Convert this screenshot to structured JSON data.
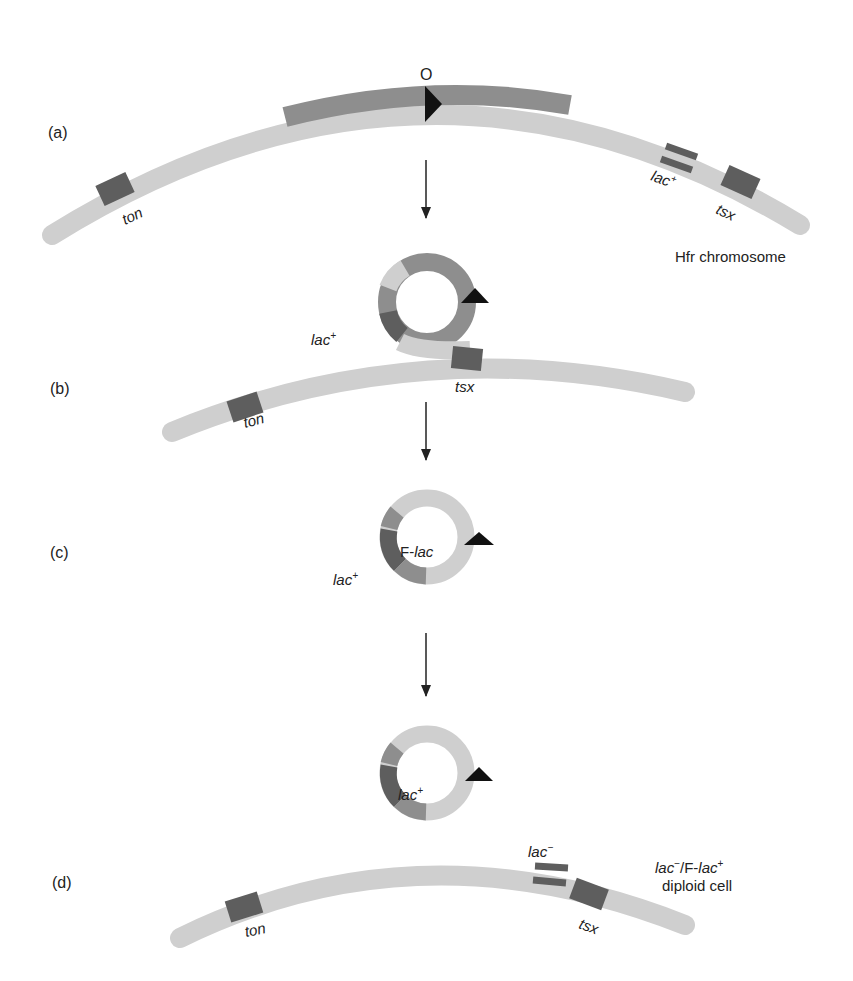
{
  "figure": {
    "panels": [
      {
        "id": "a",
        "label": "(a)",
        "origin_label": "O",
        "chromosome_caption": "Hfr chromosome",
        "genes": [
          "ton",
          "lac",
          "tsx"
        ],
        "lac_sup": "+"
      },
      {
        "id": "b",
        "label": "(b)",
        "genes": [
          "ton",
          "tsx"
        ],
        "loop_gene": "lac",
        "loop_sup": "+"
      },
      {
        "id": "c",
        "label": "(c)",
        "plasmid_name_prefix": "F-",
        "plasmid_name_gene": "lac",
        "gene": "lac",
        "gene_sup": "+"
      },
      {
        "id": "d",
        "label": "(d)",
        "plasmid_gene": "lac",
        "plasmid_sup": "+",
        "chrom_genes": [
          "ton",
          "lac",
          "tsx"
        ],
        "chrom_lac_sup": "−",
        "caption_gene1": "lac",
        "caption_sup1": "−",
        "caption_mid": "/F-",
        "caption_gene2": "lac",
        "caption_sup2": "+",
        "caption_line2": "diploid cell"
      }
    ],
    "colors": {
      "light": "#cfcfcf",
      "medium": "#8e8e8e",
      "dark": "#5e5e5e",
      "origin": "#111111",
      "arrow": "#222222"
    }
  }
}
